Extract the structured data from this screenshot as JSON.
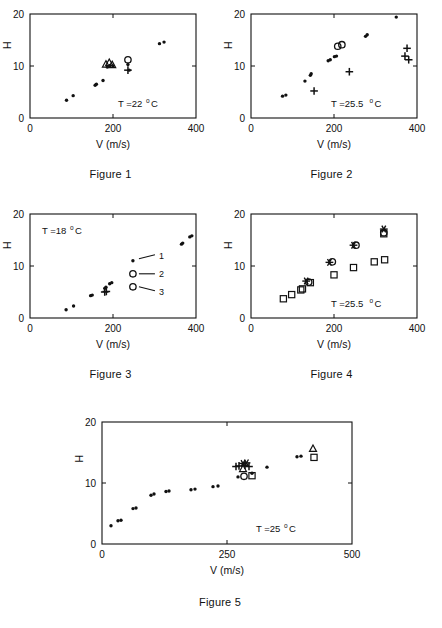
{
  "page": {
    "background": "#ffffff",
    "ink": "#111111"
  },
  "figures": [
    {
      "id": "figure-1",
      "caption": "Figure 1",
      "annotation": {
        "prefix": "T =22",
        "degree": "o",
        "unit": "C"
      },
      "chart_data": {
        "type": "scatter",
        "title": "Figure 1",
        "xlabel": "V (m/s)",
        "ylabel": "H",
        "xlim": [
          0,
          400
        ],
        "ylim": [
          0,
          20
        ],
        "xticks": [
          0,
          200,
          400
        ],
        "yticks": [
          0,
          10,
          20
        ],
        "grid": false,
        "legend": "none",
        "annotation_text": "T =22 °C",
        "series": [
          {
            "name": "1",
            "marker": "dot",
            "points": [
              [
                88,
                3.4
              ],
              [
                104,
                4.3
              ],
              [
                157,
                6.3
              ],
              [
                160,
                6.5
              ],
              [
                176,
                7.2
              ],
              [
                186,
                9.8
              ],
              [
                193,
                10.1
              ],
              [
                200,
                10.0
              ],
              [
                236,
                10.3
              ],
              [
                239,
                9.2
              ],
              [
                312,
                14.3
              ],
              [
                323,
                14.6
              ]
            ]
          },
          {
            "name": "2",
            "marker": "triangle",
            "points": [
              [
                183,
                10.3
              ],
              [
                191,
                10.6
              ],
              [
                198,
                10.2
              ]
            ]
          },
          {
            "name": "3",
            "marker": "circle",
            "points": [
              [
                236,
                11.2
              ]
            ]
          },
          {
            "name": "4",
            "marker": "plus",
            "points": [
              [
                236,
                9.2
              ]
            ]
          }
        ]
      }
    },
    {
      "id": "figure-2",
      "caption": "Figure 2",
      "annotation": {
        "prefix": "T =25.5",
        "degree": "o",
        "unit": "C"
      },
      "chart_data": {
        "type": "scatter",
        "title": "Figure 2",
        "xlabel": "V (m/s)",
        "ylabel": "H",
        "xlim": [
          0,
          400
        ],
        "ylim": [
          0,
          20
        ],
        "xticks": [
          0,
          200,
          400
        ],
        "yticks": [
          0,
          10,
          20
        ],
        "grid": false,
        "legend": "none",
        "annotation_text": "T =25.5 °C",
        "series": [
          {
            "name": "1",
            "marker": "dot",
            "points": [
              [
                76,
                4.2
              ],
              [
                84,
                4.4
              ],
              [
                130,
                7.1
              ],
              [
                143,
                8.2
              ],
              [
                145,
                8.5
              ],
              [
                186,
                11.0
              ],
              [
                191,
                11.2
              ],
              [
                201,
                11.8
              ],
              [
                206,
                11.9
              ],
              [
                276,
                15.7
              ],
              [
                280,
                16.0
              ],
              [
                350,
                19.4
              ]
            ]
          },
          {
            "name": "2",
            "marker": "circle",
            "points": [
              [
                209,
                13.8
              ],
              [
                219,
                14.1
              ]
            ]
          },
          {
            "name": "3",
            "marker": "plus",
            "points": [
              [
                152,
                5.2
              ],
              [
                237,
                8.9
              ],
              [
                376,
                13.4
              ],
              [
                371,
                11.9
              ],
              [
                380,
                11.2
              ]
            ]
          }
        ]
      }
    },
    {
      "id": "figure-3",
      "caption": "Figure 3",
      "annotation": {
        "prefix": "T =18",
        "degree": "o",
        "unit": "C"
      },
      "legend": {
        "items": [
          {
            "label": "1",
            "marker": "dot"
          },
          {
            "label": "2",
            "marker": "circle"
          },
          {
            "label": "3",
            "marker": "circle"
          }
        ]
      },
      "chart_data": {
        "type": "scatter",
        "title": "Figure 3",
        "xlabel": "V (m/s)",
        "ylabel": "H",
        "xlim": [
          0,
          400
        ],
        "ylim": [
          0,
          20
        ],
        "xticks": [
          0,
          200,
          400
        ],
        "yticks": [
          0,
          10,
          20
        ],
        "grid": false,
        "legend": "inside-right",
        "legend_entries": [
          "1",
          "2",
          "3"
        ],
        "annotation_text": "T =18 °C",
        "series": [
          {
            "name": "1",
            "marker": "dot",
            "points": [
              [
                87,
                1.6
              ],
              [
                105,
                2.3
              ],
              [
                146,
                4.3
              ],
              [
                150,
                4.4
              ],
              [
                180,
                5.7
              ],
              [
                183,
                5.9
              ],
              [
                192,
                6.6
              ],
              [
                197,
                6.8
              ],
              [
                365,
                14.2
              ],
              [
                368,
                14.4
              ],
              [
                385,
                15.6
              ],
              [
                390,
                15.8
              ]
            ]
          },
          {
            "name": "2",
            "marker": "plus",
            "points": [
              [
                180,
                5.0
              ],
              [
                184,
                5.1
              ]
            ]
          }
        ]
      }
    },
    {
      "id": "figure-4",
      "caption": "Figure 4",
      "annotation": {
        "prefix": "T =25.5",
        "degree": "o",
        "unit": "C"
      },
      "chart_data": {
        "type": "scatter",
        "title": "Figure 4",
        "xlabel": "V (m/s)",
        "ylabel": "H",
        "xlim": [
          0,
          400
        ],
        "ylim": [
          0,
          20
        ],
        "xticks": [
          0,
          200,
          400
        ],
        "yticks": [
          0,
          10,
          20
        ],
        "grid": false,
        "legend": "none",
        "annotation_text": "T =25.5 °C",
        "series": [
          {
            "name": "1",
            "marker": "square",
            "points": [
              [
                78,
                3.7
              ],
              [
                98,
                4.5
              ],
              [
                120,
                5.4
              ],
              [
                124,
                5.6
              ],
              [
                143,
                6.8
              ],
              [
                200,
                8.3
              ],
              [
                247,
                9.7
              ],
              [
                297,
                10.8
              ],
              [
                322,
                11.2
              ],
              [
                320,
                16.2
              ]
            ]
          },
          {
            "name": "2",
            "marker": "circle",
            "points": [
              [
                139,
                6.9
              ],
              [
                196,
                10.8
              ],
              [
                253,
                14.0
              ],
              [
                320,
                16.4
              ]
            ]
          },
          {
            "name": "3",
            "marker": "asterisk",
            "points": [
              [
                133,
                7.1
              ],
              [
                189,
                10.7
              ],
              [
                247,
                14.0
              ],
              [
                320,
                17.1
              ]
            ]
          }
        ]
      }
    },
    {
      "id": "figure-5",
      "caption": "Figure 5",
      "annotation": {
        "prefix": "T =25",
        "degree": "o",
        "unit": "C"
      },
      "chart_data": {
        "type": "scatter",
        "title": "Figure 5",
        "xlabel": "V (m/s)",
        "ylabel": "H",
        "xlim": [
          0,
          500
        ],
        "ylim": [
          0,
          20
        ],
        "xticks": [
          0,
          250,
          500
        ],
        "yticks": [
          0,
          10,
          20
        ],
        "grid": false,
        "legend": "none",
        "annotation_text": "T =25 °C",
        "series": [
          {
            "name": "1",
            "marker": "dot",
            "points": [
              [
                18,
                3.0
              ],
              [
                32,
                3.8
              ],
              [
                38,
                3.9
              ],
              [
                62,
                5.8
              ],
              [
                68,
                5.9
              ],
              [
                98,
                8.0
              ],
              [
                104,
                8.2
              ],
              [
                128,
                8.6
              ],
              [
                134,
                8.7
              ],
              [
                178,
                8.9
              ],
              [
                186,
                9.0
              ],
              [
                222,
                9.4
              ],
              [
                232,
                9.5
              ],
              [
                272,
                11.0
              ],
              [
                300,
                11.6
              ],
              [
                330,
                12.6
              ],
              [
                390,
                14.3
              ],
              [
                398,
                14.4
              ]
            ]
          },
          {
            "name": "2",
            "marker": "plus",
            "points": [
              [
                268,
                12.7
              ],
              [
                274,
                12.8
              ],
              [
                286,
                12.9
              ],
              [
                294,
                12.7
              ]
            ]
          },
          {
            "name": "3",
            "marker": "asterisk",
            "points": [
              [
                282,
                13.2
              ],
              [
                289,
                13.3
              ]
            ]
          },
          {
            "name": "4",
            "marker": "triangle",
            "points": [
              [
                282,
                12.3
              ],
              [
                422,
                15.6
              ]
            ]
          },
          {
            "name": "5",
            "marker": "circle",
            "points": [
              [
                284,
                11.1
              ]
            ]
          },
          {
            "name": "6",
            "marker": "square",
            "points": [
              [
                300,
                11.2
              ],
              [
                424,
                14.2
              ]
            ]
          }
        ]
      }
    }
  ]
}
